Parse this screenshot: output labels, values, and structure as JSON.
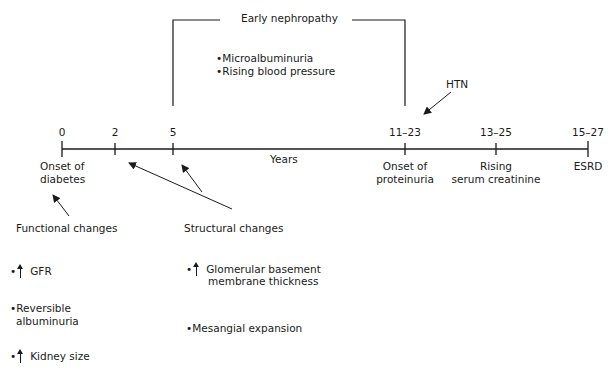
{
  "bracket": {
    "title": "Early nephropathy",
    "items": [
      "Microalbuminuria",
      "Rising blood pressure"
    ]
  },
  "timeline": {
    "axis_label": "Years",
    "ticks": [
      {
        "value": "0",
        "label_line1": "Onset of",
        "label_line2": "diabetes"
      },
      {
        "value": "2"
      },
      {
        "value": "5"
      },
      {
        "value": "11–23",
        "label_line1": "Onset of",
        "label_line2": "proteinuria"
      },
      {
        "value": "13–25",
        "label_line1": "Rising",
        "label_line2": "serum creatinine"
      },
      {
        "value": "15–27",
        "label_line1": "ESRD"
      }
    ],
    "htn_label": "HTN"
  },
  "functional": {
    "heading": "Functional changes",
    "items": [
      {
        "arrow": "up",
        "text": "GFR"
      },
      {
        "arrow": "",
        "text_line1": "Reversible",
        "text_line2": "albuminuria"
      },
      {
        "arrow": "up",
        "text": "Kidney size"
      }
    ]
  },
  "structural": {
    "heading": "Structural changes",
    "items": [
      {
        "arrow": "up",
        "text_line1": "Glomerular basement",
        "text_line2": "membrane thickness"
      },
      {
        "arrow": "",
        "text": "Mesangial expansion"
      }
    ]
  }
}
